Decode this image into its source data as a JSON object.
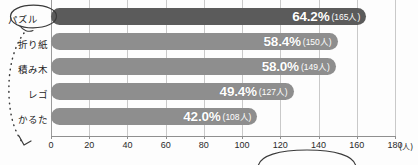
{
  "chart_data": {
    "type": "bar",
    "orientation": "horizontal",
    "title": "",
    "xlabel": "(人)",
    "ylabel": "",
    "xlim": [
      0,
      180
    ],
    "grid": true,
    "legend": false,
    "categories": [
      "パズル",
      "折り紙",
      "積み木",
      "レゴ",
      "かるた"
    ],
    "values": [
      165,
      150,
      149,
      127,
      108
    ],
    "percent_values": [
      64.2,
      58.4,
      58.0,
      49.4,
      42.0
    ],
    "value_labels": [
      {
        "pct": "64.2%",
        "count": "(165人)"
      },
      {
        "pct": "58.4%",
        "count": "(150人)"
      },
      {
        "pct": "58.0%",
        "count": "(149人)"
      },
      {
        "pct": "49.4%",
        "count": "(127人)"
      },
      {
        "pct": "42.0%",
        "count": "(108人)"
      }
    ],
    "xticks": [
      0,
      20,
      40,
      60,
      80,
      100,
      120,
      140,
      160,
      180
    ],
    "xtick_labels": [
      "0",
      "20",
      "40",
      "60",
      "80",
      "100",
      "120",
      "140",
      "160",
      "180"
    ],
    "bar_colors": [
      "#5b5b5b",
      "#8e8e8e",
      "#8e8e8e",
      "#8e8e8e",
      "#8e8e8e"
    ],
    "highlighted_category": "パズル"
  },
  "axis": {
    "unit_label": "(人)"
  },
  "annotations": {
    "circle_top_label": "パズル",
    "pointer_style": "dotted-curved-arrow",
    "bottom_ellipse": "partial-ellipse-below-axis",
    "ink_color": "#3a3a3a"
  },
  "colors": {
    "bar_dark": "#5b5b5b",
    "bar_light": "#8e8e8e",
    "gridline": "#c9c9c9",
    "axis": "#8f8f8f",
    "value_text": "#ffffff",
    "label_text": "#1d1d1d",
    "background": "#fdfdfd"
  }
}
